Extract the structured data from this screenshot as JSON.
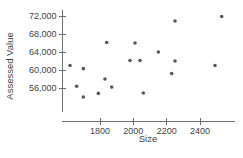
{
  "chart_data": {
    "type": "scatter",
    "title": "",
    "xlabel": "Size",
    "ylabel": "Assessed Value",
    "xlim": [
      1580,
      2520
    ],
    "ylim": [
      52500,
      73500
    ],
    "grid": false,
    "legend": null,
    "x_ticks": [
      1800,
      2000,
      2200,
      2400
    ],
    "x_tick_labels": [
      "1800",
      "2000",
      "2200",
      "2400"
    ],
    "y_ticks": [
      56000,
      60000,
      64000,
      68000,
      72000
    ],
    "y_tick_labels": [
      "56,000",
      "60,000",
      "64,000",
      "68,000",
      "72,000"
    ],
    "marker": "circle",
    "marker_color": "#585858",
    "marker_size": 3.6,
    "points": [
      {
        "x": 1620,
        "y": 61000
      },
      {
        "x": 1700,
        "y": 60300
      },
      {
        "x": 1660,
        "y": 56400
      },
      {
        "x": 1700,
        "y": 54000
      },
      {
        "x": 1840,
        "y": 66100
      },
      {
        "x": 2010,
        "y": 66000
      },
      {
        "x": 1980,
        "y": 62100
      },
      {
        "x": 2040,
        "y": 62100
      },
      {
        "x": 1830,
        "y": 58000
      },
      {
        "x": 1870,
        "y": 56200
      },
      {
        "x": 1790,
        "y": 54800
      },
      {
        "x": 2060,
        "y": 54900
      },
      {
        "x": 2250,
        "y": 70900
      },
      {
        "x": 2150,
        "y": 64000
      },
      {
        "x": 2250,
        "y": 62000
      },
      {
        "x": 2230,
        "y": 59200
      },
      {
        "x": 2490,
        "y": 61000
      },
      {
        "x": 2530,
        "y": 71900
      }
    ]
  },
  "axis": {
    "x_axis_name": "size-axis",
    "y_axis_name": "assessed-value-axis"
  }
}
